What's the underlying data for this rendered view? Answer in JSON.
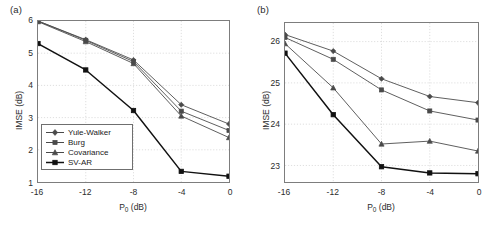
{
  "figure": {
    "panels": [
      {
        "label": "(a)",
        "xlabel_main": "P",
        "xlabel_sub": "0",
        "xlabel_unit": " (dB)",
        "ylabel": "IMSE (dB)",
        "xticks": [
          "-16",
          "-12",
          "-8",
          "-4",
          "0"
        ],
        "yticks": [
          "1",
          "2",
          "3",
          "4",
          "5",
          "6"
        ]
      },
      {
        "label": "(b)",
        "xlabel_main": "P",
        "xlabel_sub": "0",
        "xlabel_unit": " (dB)",
        "ylabel": "IMSE (dB)",
        "xticks": [
          "-16",
          "-12",
          "-8",
          "-4",
          "0"
        ],
        "yticks": [
          "23",
          "24",
          "25",
          "26"
        ]
      }
    ],
    "legend": [
      {
        "label": "Yule-Walker",
        "marker": "diamond"
      },
      {
        "label": "Burg",
        "marker": "square"
      },
      {
        "label": "Covariance",
        "marker": "triangle"
      },
      {
        "label": "SV-AR",
        "marker": "square-filled"
      }
    ]
  },
  "chart_data": [
    {
      "type": "line",
      "panel": "(a)",
      "title": "",
      "xlabel": "P0 (dB)",
      "ylabel": "IMSE (dB)",
      "x": [
        -16,
        -12,
        -8,
        -4,
        0
      ],
      "xlim": [
        -16,
        0
      ],
      "ylim": [
        1,
        6
      ],
      "grid": true,
      "legend_position": "lower-left",
      "series": [
        {
          "name": "Yule-Walker",
          "marker": "diamond",
          "color": "#4a4a4a",
          "values": [
            6.0,
            5.42,
            4.79,
            3.4,
            2.8
          ]
        },
        {
          "name": "Burg",
          "marker": "square",
          "color": "#4a4a4a",
          "values": [
            6.0,
            5.4,
            4.74,
            3.2,
            2.6
          ]
        },
        {
          "name": "Covariance",
          "marker": "triangle",
          "color": "#4a4a4a",
          "values": [
            5.98,
            5.36,
            4.68,
            3.05,
            2.38
          ]
        },
        {
          "name": "SV-AR",
          "marker": "square-filled",
          "color": "#111111",
          "values": [
            5.3,
            4.48,
            3.22,
            1.33,
            1.18
          ]
        }
      ]
    },
    {
      "type": "line",
      "panel": "(b)",
      "title": "",
      "xlabel": "P0 (dB)",
      "ylabel": "IMSE (dB)",
      "x": [
        -16,
        -12,
        -8,
        -4,
        0
      ],
      "xlim": [
        -16,
        0
      ],
      "ylim": [
        22.6,
        26.45
      ],
      "grid": true,
      "legend_position": "none",
      "series": [
        {
          "name": "Yule-Walker",
          "marker": "diamond",
          "color": "#4a4a4a",
          "values": [
            26.17,
            25.77,
            25.1,
            24.67,
            24.52
          ]
        },
        {
          "name": "Burg",
          "marker": "square",
          "color": "#4a4a4a",
          "values": [
            26.1,
            25.57,
            24.83,
            24.32,
            24.1
          ]
        },
        {
          "name": "Covariance",
          "marker": "triangle",
          "color": "#4a4a4a",
          "values": [
            25.95,
            24.88,
            23.52,
            23.59,
            23.35
          ]
        },
        {
          "name": "SV-AR",
          "marker": "square-filled",
          "color": "#111111",
          "values": [
            25.72,
            24.23,
            22.97,
            22.82,
            22.8
          ]
        }
      ]
    }
  ]
}
